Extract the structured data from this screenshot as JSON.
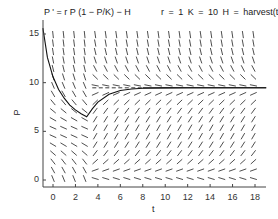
{
  "chart_data": {
    "type": "line",
    "subtype": "slope-field-with-solution",
    "title_left": "P ' = r P (1 − P/K) − H",
    "title_right": "r = 1    K = 10    H = harvest(t)",
    "xlabel": "t",
    "ylabel": "P",
    "xlim": [
      -0.9,
      19
    ],
    "ylim": [
      -0.7,
      16.4
    ],
    "xticks": [
      0,
      2,
      4,
      6,
      8,
      10,
      12,
      14,
      16,
      18
    ],
    "yticks": [
      0,
      5,
      10,
      15
    ],
    "params": {
      "r": 1,
      "K": 10
    },
    "harvest": {
      "switch_t": 3,
      "before": 3.0,
      "after": 0.5
    },
    "slope_field": {
      "t_values": [
        0,
        0.94,
        1.88,
        2.82,
        3.76,
        4.7,
        5.64,
        6.58,
        7.52,
        8.46,
        9.4,
        10.34,
        11.28,
        12.22,
        13.16,
        14.1,
        15.04,
        15.98,
        16.92,
        17.86
      ],
      "p_start": 0,
      "p_step": 0.87,
      "p_count": 18
    },
    "solution_curve": {
      "t": [
        -0.9,
        -0.5,
        0,
        0.5,
        1,
        1.5,
        2,
        2.5,
        3,
        3.5,
        4,
        5,
        6,
        7,
        8,
        10,
        12,
        14,
        16,
        18,
        19
      ],
      "P": [
        15.6,
        12.6,
        10.6,
        9.3,
        8.4,
        7.7,
        7.2,
        6.8,
        6.5,
        7.3,
        8.0,
        8.8,
        9.2,
        9.35,
        9.42,
        9.46,
        9.47,
        9.47,
        9.47,
        9.47,
        9.47
      ]
    },
    "equilibrium_line": {
      "P": 9.47,
      "t_from": 3.5,
      "t_to": 19,
      "style": "dashed-then-solid"
    },
    "grid": false,
    "legend": null
  },
  "labels": {
    "title_left": "P ' = r P (1 − P/K) − H",
    "title_right": "r = 1    K = 10    H = harvest(t)",
    "xlabel": "t",
    "ylabel": "P"
  }
}
